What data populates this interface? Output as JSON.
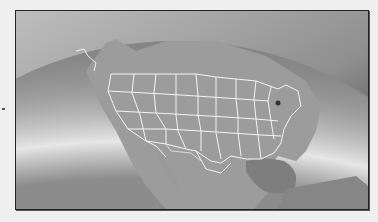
{
  "map": {
    "title": "",
    "subject": "North America globe view with US state boundaries",
    "colors": {
      "space_gradient_top": "#c8c8c8",
      "space_gradient_edge": "#3a3a3a",
      "ocean": "#8a8a8a",
      "land": "#9a9a9a",
      "gulf": "#7c7c7c",
      "borders": "#f2f2f2",
      "marker": "#333333"
    },
    "marker": {
      "label": "location-marker"
    }
  }
}
